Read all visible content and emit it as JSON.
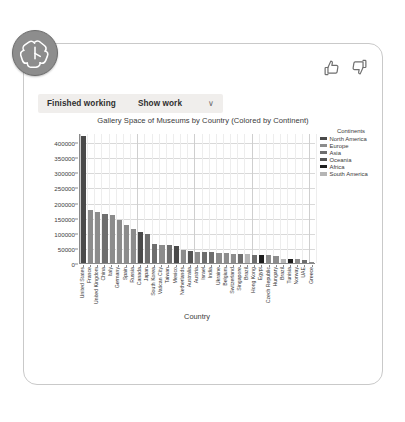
{
  "avatar": {
    "name": "openai-logo",
    "bg": "#8d8d8d"
  },
  "feedback": {
    "thumbs_up": "thumbs-up",
    "thumbs_down": "thumbs-down"
  },
  "toolbar": {
    "status_label": "Finished working",
    "show_work_label": "Show work",
    "chevron": "∨"
  },
  "chart_data": {
    "type": "bar",
    "title": "Gallery Space of Museums by Country (Colored by Continent)",
    "xlabel": "Country",
    "ylabel": "Total Gallery Space(m²)",
    "ylim": [
      0,
      430000
    ],
    "yticks": [
      0,
      50000,
      100000,
      150000,
      200000,
      250000,
      300000,
      350000,
      400000
    ],
    "ytick_labels": [
      "0",
      "50000",
      "100000",
      "150000",
      "200000",
      "250000",
      "300000",
      "350000",
      "400000"
    ],
    "grid": true,
    "legend_position": "top-right",
    "legend_title": "Continents",
    "legend": [
      {
        "name": "North America",
        "color": "#4a4a4a"
      },
      {
        "name": "Europe",
        "color": "#8c8c8c"
      },
      {
        "name": "Asia",
        "color": "#6e6e6e"
      },
      {
        "name": "Oceania",
        "color": "#555555"
      },
      {
        "name": "Africa",
        "color": "#1f1f1f"
      },
      {
        "name": "South America",
        "color": "#b5b5b5"
      }
    ],
    "categories": [
      "United States",
      "France",
      "United Kingdom",
      "China",
      "Italy",
      "Germany",
      "Spain",
      "Russia",
      "Canada",
      "Japan",
      "South Korea",
      "Vatican City",
      "Taiwan",
      "Mexico",
      "Netherlands",
      "Australia",
      "Austria",
      "Israel",
      "India",
      "Ukraine",
      "Belgium",
      "Switzerland",
      "Singapore",
      "Brazil",
      "Hong Kong",
      "Egypt",
      "Czech Republic",
      "Hungary",
      "Brazil",
      "Tunisia",
      "Norway",
      "UAE",
      "Greece"
    ],
    "values": [
      420000,
      177000,
      168000,
      163000,
      160000,
      143000,
      125000,
      113000,
      103000,
      95000,
      62000,
      60000,
      58000,
      55000,
      42000,
      40000,
      38000,
      37000,
      36000,
      33000,
      32000,
      31000,
      30000,
      29000,
      28000,
      27000,
      26000,
      24000,
      14000,
      13000,
      12000,
      10000,
      5000
    ],
    "continents": [
      "North America",
      "Europe",
      "Europe",
      "Asia",
      "Europe",
      "Europe",
      "Europe",
      "Europe",
      "North America",
      "Asia",
      "Asia",
      "Europe",
      "Asia",
      "North America",
      "Europe",
      "Oceania",
      "Europe",
      "Asia",
      "Asia",
      "Europe",
      "Europe",
      "Europe",
      "Asia",
      "South America",
      "Asia",
      "Africa",
      "Europe",
      "Europe",
      "South America",
      "Africa",
      "Europe",
      "Asia",
      "Europe"
    ]
  }
}
